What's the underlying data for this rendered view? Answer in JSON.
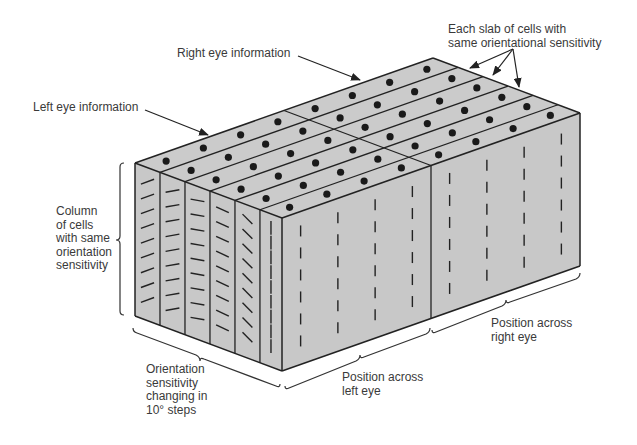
{
  "diagram": {
    "colors": {
      "face_fill": "#c8c8c8",
      "top_fill": "#cbcbcb",
      "edge": "#222222",
      "dot": "#1a1a1a",
      "text": "#3a3a3a"
    },
    "labels": {
      "right_eye_info": "Right eye information",
      "left_eye_info": "Left eye information",
      "slab": "Each slab of cells with\nsame orientational sensitivity",
      "column": "Column\nof cells\nwith same\norientation\nsensitivity",
      "orientation_steps": "Orientation\nsensitivity\nchanging in\n10° steps",
      "left_eye_position": "Position across\nleft eye",
      "right_eye_position": "Position across\nright eye"
    },
    "geometry": {
      "left_top": [
        135,
        163
      ],
      "front_top": [
        282,
        218
      ],
      "right_top": [
        580,
        113
      ],
      "height": 153,
      "slab_fractions": [
        0,
        0.17,
        0.34,
        0.51,
        0.68,
        0.85,
        1.0
      ],
      "eye_split": 0.5
    },
    "orientation_angles_deg": [
      -20,
      -10,
      10,
      25,
      45,
      90
    ]
  }
}
